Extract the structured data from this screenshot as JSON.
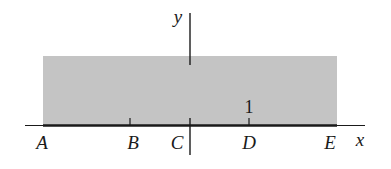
{
  "diagram": {
    "colors": {
      "shade": "#c4c4c4",
      "line": "#1a1a1a",
      "background": "#ffffff"
    },
    "axes": {
      "x_label": "x",
      "y_label": "y"
    },
    "shaded_region": {
      "description": "horizontal strip above the x-axis from A to E"
    },
    "points": [
      {
        "label": "A",
        "x": 42
      },
      {
        "label": "B",
        "x": 133
      },
      {
        "label": "C",
        "x": 177
      },
      {
        "label": "D",
        "x": 249
      },
      {
        "label": "E",
        "x": 330
      }
    ],
    "tick_marks": [
      {
        "name": "B",
        "x": 130
      },
      {
        "name": "D",
        "x": 249,
        "value_label": "1"
      }
    ],
    "unit_label": "1"
  }
}
